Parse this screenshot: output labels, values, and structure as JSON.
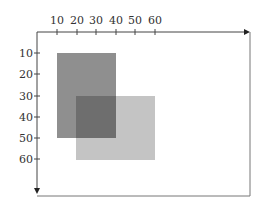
{
  "diagram": {
    "type": "coordinate-grid-overlapping-rectangles",
    "x_axis": {
      "position": "top",
      "ticks": [
        "10",
        "20",
        "30",
        "40",
        "50",
        "60"
      ],
      "arrow_direction": "right"
    },
    "y_axis": {
      "position": "left",
      "ticks": [
        "10",
        "20",
        "30",
        "40",
        "50",
        "60"
      ],
      "arrow_direction": "down"
    },
    "rectangles": [
      {
        "name": "rect-a",
        "x1": 10,
        "y1": 10,
        "x2": 40,
        "y2": 50,
        "color": "#8f8f8f"
      },
      {
        "name": "rect-b",
        "x1": 20,
        "y1": 30,
        "x2": 60,
        "y2": 60,
        "color": "#c4c4c4"
      }
    ],
    "overlap_color": "#6e6e6e"
  }
}
